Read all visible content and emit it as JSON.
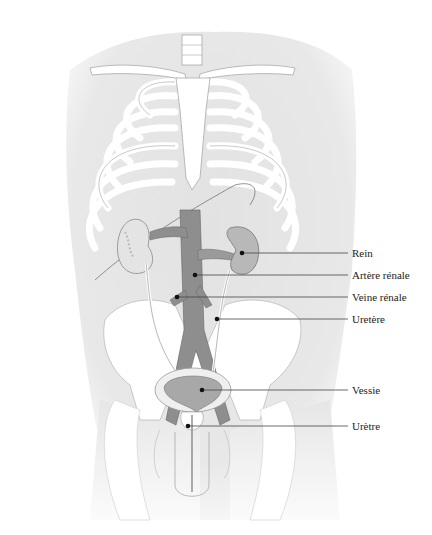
{
  "diagram": {
    "labels": [
      {
        "id": "rein",
        "text": "Rein",
        "point": [
          242,
          253
        ],
        "line_y": 253,
        "label_x": 352
      },
      {
        "id": "artere-renale",
        "text": "Artère rénale",
        "point": [
          195,
          275
        ],
        "line_y": 275,
        "label_x": 352
      },
      {
        "id": "veine-renale",
        "text": "Veine rénale",
        "point": [
          177,
          297
        ],
        "line_y": 297,
        "label_x": 352
      },
      {
        "id": "uretere",
        "text": "Uretère",
        "point": [
          217,
          319
        ],
        "line_y": 319,
        "label_x": 352
      },
      {
        "id": "vessie",
        "text": "Vessie",
        "point": [
          202,
          390
        ],
        "line_y": 390,
        "label_x": 352
      },
      {
        "id": "uretre",
        "text": "Urètre",
        "point": [
          188,
          426
        ],
        "line_y": 426,
        "label_x": 352
      }
    ],
    "colors": {
      "body": "#e4e4e4",
      "bone": "#ffffff",
      "outline": "#9a9a9a",
      "organ": "#b8b8b8",
      "vessel": "#8e8e8e",
      "leader": "#444444",
      "text": "#222222"
    }
  }
}
